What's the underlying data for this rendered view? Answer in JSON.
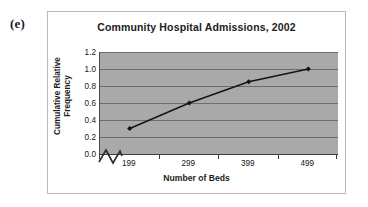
{
  "figure": {
    "label": "(e)"
  },
  "chart_data": {
    "type": "line",
    "title": "Community Hospital Admissions, 2002",
    "xlabel": "Number of Beds",
    "ylabel": "Cumulative Relative Frequency",
    "ylabel_line1": "Cumulative Relative",
    "ylabel_line2": "Frequency",
    "categories": [
      "199",
      "299",
      "399",
      "499"
    ],
    "values": [
      0.3,
      0.6,
      0.85,
      1.0
    ],
    "series": [
      {
        "name": "Cumulative Relative Frequency",
        "values": [
          0.3,
          0.6,
          0.85,
          1.0
        ]
      }
    ],
    "ylim": [
      0.0,
      1.2
    ],
    "ytick_labels": [
      "0.0",
      "0.2",
      "0.4",
      "0.6",
      "0.8",
      "1.0",
      "1.2"
    ],
    "ytick_values": [
      0.0,
      0.2,
      0.4,
      0.6,
      0.8,
      1.0,
      1.2
    ],
    "grid": "horizontal",
    "legend": "none",
    "axis_break": "y-axis-break-zigzag",
    "marker": "diamond",
    "colors": {
      "plot_background": "#a9a9a9",
      "gridline": "#6d6d6d",
      "series_line": "#141414",
      "marker": "#141414",
      "frame_border": "#b9b9b9",
      "page_background": "#ffffff",
      "text": "#1c1c1c"
    }
  }
}
